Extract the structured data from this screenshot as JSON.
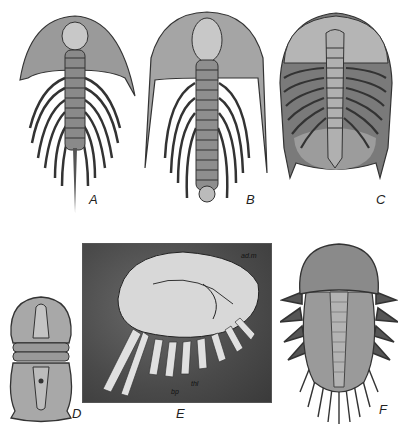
{
  "figure": {
    "panels": [
      {
        "id": "A",
        "label": "A",
        "subject": "trilobite with long genal spines and long tail spine"
      },
      {
        "id": "B",
        "label": "B",
        "subject": "trilobite with very long genal spines, narrow segmented axis"
      },
      {
        "id": "C",
        "label": "C",
        "subject": "broad oval trilobite with large pygidium"
      },
      {
        "id": "D",
        "label": "D",
        "subject": "small agnostid trilobite, two shields"
      },
      {
        "id": "E",
        "label": "E",
        "subject": "fossil photograph of trilobite in lateral view showing appendages",
        "annotations": [
          "thl",
          "bp",
          "ad.m"
        ]
      },
      {
        "id": "F",
        "label": "F",
        "subject": "trilobite with spiny margin and rounded cephalon"
      }
    ],
    "colors": {
      "background": "#ffffff",
      "ink": "#222222",
      "photo_bg": "#4a4a4a"
    }
  }
}
